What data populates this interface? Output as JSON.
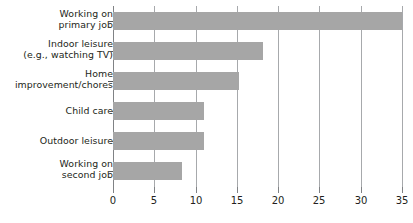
{
  "chart_data": {
    "type": "bar",
    "orientation": "horizontal",
    "title": "",
    "subtitle": "",
    "xlabel": "",
    "ylabel": "",
    "xlim": [
      0,
      35
    ],
    "xticks": [
      0,
      5,
      10,
      15,
      20,
      25,
      30,
      35
    ],
    "xticklabels": [
      "0",
      "5",
      "10",
      "15",
      "20",
      "25",
      "30",
      "35"
    ],
    "grid": true,
    "legend": false,
    "categories": [
      "Working on primary job",
      "Indoor leisure (e.g., watching TV)",
      "Home improvement/chores",
      "Child care",
      "Outdoor leisure",
      "Working on second job"
    ],
    "category_lines": [
      [
        "Working on",
        "primary job"
      ],
      [
        "Indoor leisure",
        "(e.g., watching TV)"
      ],
      [
        "Home",
        "improvement/chores"
      ],
      [
        "Child care"
      ],
      [
        "Outdoor leisure"
      ],
      [
        "Working on",
        "second job"
      ]
    ],
    "values": [
      35.0,
      18.2,
      15.2,
      11.0,
      11.0,
      8.3
    ],
    "series": [
      {
        "name": "",
        "values": [
          35.0,
          18.2,
          15.2,
          11.0,
          11.0,
          8.3
        ]
      }
    ]
  },
  "style": {
    "bar_color": "#a6a6a6",
    "gridline_color": "#a7a9ac",
    "axis_color": "#808285",
    "text_color": "#231f20",
    "background": "#ffffff"
  }
}
